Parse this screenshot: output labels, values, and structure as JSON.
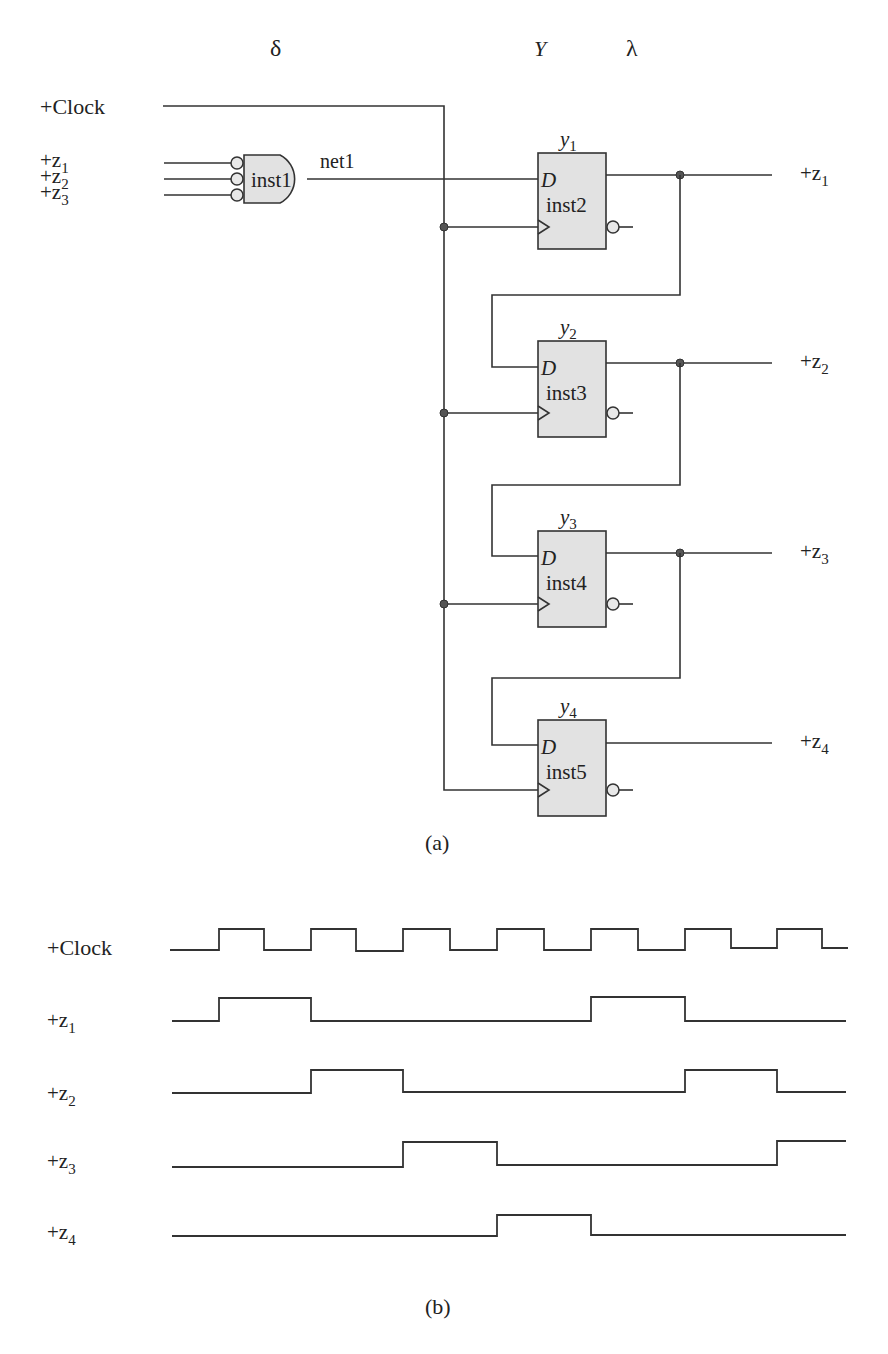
{
  "circuit": {
    "column_headers": {
      "delta": "δ",
      "Y": "Y",
      "lambda": "λ"
    },
    "inputs": {
      "clock": "+Clock",
      "z1": "+z",
      "z1_sub": "1",
      "z2": "+z",
      "z2_sub": "2",
      "z3": "+z",
      "z3_sub": "3"
    },
    "gate": {
      "name": "inst1",
      "type": "AND (active-low inputs)",
      "output_net": "net1"
    },
    "flip_flops": [
      {
        "name": "inst2",
        "state": "y",
        "state_sub": "1",
        "d_label": "D",
        "output": "+z",
        "output_sub": "1"
      },
      {
        "name": "inst3",
        "state": "y",
        "state_sub": "2",
        "d_label": "D",
        "output": "+z",
        "output_sub": "2"
      },
      {
        "name": "inst4",
        "state": "y",
        "state_sub": "3",
        "d_label": "D",
        "output": "+z",
        "output_sub": "3"
      },
      {
        "name": "inst5",
        "state": "y",
        "state_sub": "4",
        "d_label": "D",
        "output": "+z",
        "output_sub": "4"
      }
    ],
    "caption": "(a)"
  },
  "timing": {
    "caption": "(b)",
    "signals": [
      {
        "name": "+Clock",
        "label": "+Clock",
        "sub": "",
        "values": [
          0,
          1,
          0,
          1,
          0,
          1,
          0,
          1,
          0,
          1,
          0,
          1,
          0,
          1,
          0
        ]
      },
      {
        "name": "+z1",
        "label": "+z",
        "sub": "1",
        "values": [
          0,
          1,
          0,
          0,
          0,
          0,
          0,
          0,
          1,
          0,
          0,
          0,
          0,
          0,
          0
        ]
      },
      {
        "name": "+z2",
        "label": "+z",
        "sub": "2",
        "values": [
          0,
          0,
          1,
          0,
          0,
          0,
          0,
          0,
          0,
          1,
          0,
          0,
          0,
          0,
          0
        ]
      },
      {
        "name": "+z3",
        "label": "+z",
        "sub": "3",
        "values": [
          0,
          0,
          0,
          1,
          0,
          0,
          0,
          0,
          0,
          0,
          1,
          0,
          0,
          0,
          0
        ]
      },
      {
        "name": "+z4",
        "label": "+z",
        "sub": "4",
        "values": [
          0,
          0,
          0,
          0,
          1,
          0,
          0,
          0,
          0,
          0,
          0,
          0,
          0,
          0,
          0
        ]
      }
    ]
  }
}
